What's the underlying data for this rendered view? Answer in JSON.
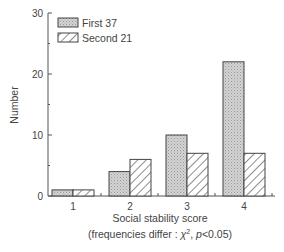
{
  "chart_data": {
    "type": "bar",
    "title": "",
    "xlabel": "Social stability score",
    "xlabel_note_prefix": "(frequencies differ : ",
    "xlabel_note_chi": "χ",
    "xlabel_note_sup": "2",
    "xlabel_note_p": "p",
    "xlabel_note_suffix": "<0.05)",
    "ylabel": "Number",
    "ylim": [
      0,
      30
    ],
    "yticks": [
      "0",
      "10",
      "20",
      "30"
    ],
    "categories": [
      "1",
      "2",
      "3",
      "4"
    ],
    "series": [
      {
        "name": "First 37",
        "values": [
          1,
          4,
          10,
          22
        ],
        "pattern": "stipple"
      },
      {
        "name": "Second 21",
        "values": [
          1,
          6,
          7,
          7
        ],
        "pattern": "hatch"
      }
    ],
    "legend_position": "top-left",
    "grid": false
  }
}
